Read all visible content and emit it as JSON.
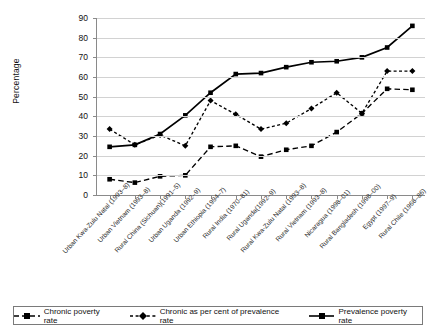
{
  "chart_data": {
    "type": "line",
    "title": "",
    "xlabel": "",
    "ylabel": "Percentage",
    "ylim": [
      0,
      90
    ],
    "yticks": [
      0,
      10,
      20,
      30,
      40,
      50,
      60,
      70,
      80,
      90
    ],
    "grid": true,
    "legend_position": "bottom",
    "categories": [
      "Urban Kwa-Zulu Natal (1993–8)",
      "Urban Vietnam (1993–8)",
      "Rural China (Sichuan)(1991–5)",
      "Urban Uganda (1992–9)",
      "Urban Ethiopia (1994–7)",
      "Rural India (1970–81)",
      "Rural Uganda(1992–9)",
      "Rural Kwa-Zulu Natal (1993–8)",
      "Rural Vietnam (1993–8)",
      "Nicaragua (1998–01)",
      "Rural Bangladesh (1998–00)",
      "Egypt (1997–9)",
      "Rural Chile (1968–86)"
    ],
    "series": [
      {
        "name": "Chronic poverty rate",
        "style": "dashed",
        "marker": "square",
        "color": "#000000",
        "values": [
          8.0,
          6.3,
          9.5,
          10.0,
          24.5,
          25.0,
          19.5,
          23.0,
          25.0,
          32.0,
          41.5,
          54.0,
          53.5
        ]
      },
      {
        "name": "Chronic as per cent of prevalence rate",
        "style": "dotted",
        "marker": "diamond",
        "color": "#000000",
        "values": [
          33.5,
          25.5,
          30.5,
          25.0,
          48.0,
          41.0,
          33.5,
          36.5,
          44.0,
          52.0,
          41.5,
          63.0,
          63.0
        ]
      },
      {
        "name": "Prevalence poverty rate",
        "style": "solid",
        "marker": "square",
        "color": "#000000",
        "values": [
          24.5,
          25.5,
          31.0,
          40.5,
          52.0,
          61.5,
          62.0,
          65.0,
          67.5,
          68.0,
          70.0,
          75.0,
          86.0
        ]
      }
    ]
  },
  "legend": {
    "items": [
      {
        "label": "Chronic poverty rate"
      },
      {
        "label": "Chronic as per cent of prevalence rate"
      },
      {
        "label": "Prevalence poverty rate"
      }
    ]
  }
}
